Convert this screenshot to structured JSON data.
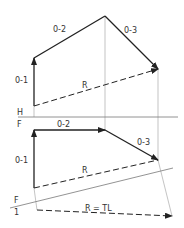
{
  "diagram": {
    "type": "descriptive-geometry-vector-resultant",
    "colors": {
      "line": "#222222",
      "projector": "#aaaaaa",
      "label": "#333333"
    },
    "top_view": {
      "vectors": [
        {
          "label": "0-1",
          "from": [
            34,
            106
          ],
          "to": [
            34,
            58
          ]
        },
        {
          "label": "0-2",
          "from": [
            34,
            58
          ],
          "to": [
            105,
            16
          ]
        },
        {
          "label": "0-3",
          "from": [
            105,
            16
          ],
          "to": [
            158,
            69
          ]
        }
      ],
      "resultant": {
        "label": "R",
        "from": [
          34,
          106
        ],
        "to": [
          158,
          69
        ],
        "style": "dashed"
      }
    },
    "fold_line_HF": {
      "upper": "H",
      "lower": "F"
    },
    "front_view": {
      "vectors": [
        {
          "label": "0-1",
          "from": [
            34,
            188
          ],
          "to": [
            34,
            130
          ]
        },
        {
          "label": "0-2",
          "from": [
            34,
            130
          ],
          "to": [
            105,
            130
          ]
        },
        {
          "label": "0-3",
          "from": [
            105,
            130
          ],
          "to": [
            158,
            160
          ]
        }
      ],
      "resultant": {
        "label": "R",
        "from": [
          34,
          188
        ],
        "to": [
          158,
          160
        ],
        "style": "dashed"
      }
    },
    "fold_line_F1": {
      "upper": "F",
      "lower": "1"
    },
    "auxiliary_view": {
      "resultant": {
        "label": "R = TL",
        "from": [
          37,
          210
        ],
        "to": [
          172,
          216
        ],
        "style": "dashed"
      }
    }
  }
}
